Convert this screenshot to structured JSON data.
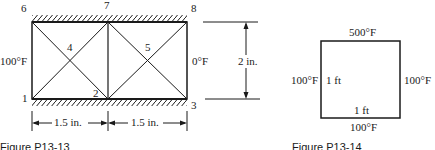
{
  "figure_left": {
    "caption": "Figure P13-13",
    "nodes": [
      {
        "id": "1",
        "label": "1"
      },
      {
        "id": "2",
        "label": "2"
      },
      {
        "id": "3",
        "label": "3"
      },
      {
        "id": "4",
        "label": "4"
      },
      {
        "id": "5",
        "label": "5"
      },
      {
        "id": "6",
        "label": "6"
      },
      {
        "id": "7",
        "label": "7"
      },
      {
        "id": "8",
        "label": "8"
      }
    ],
    "left_temp": "100°F",
    "right_temp": "0°F",
    "height_dim": "2 in.",
    "width_dim_left": "1.5 in.",
    "width_dim_right": "1.5 in."
  },
  "figure_right": {
    "caption": "Figure P13-14",
    "top_temp": "500°F",
    "bottom_temp": "100°F",
    "left_temp": "100°F",
    "right_temp": "100°F",
    "side_dim": "1 ft",
    "bottom_dim": "1 ft"
  }
}
